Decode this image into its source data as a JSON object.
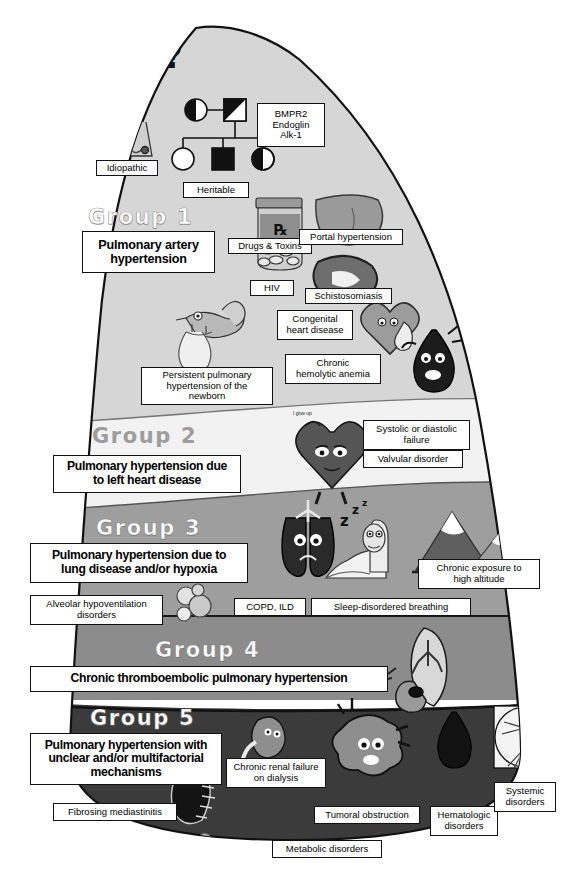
{
  "figure": {
    "shape": "sail-pyramid",
    "band_colors": {
      "group1": "#d6d6d6",
      "group2": "#f0f0f0",
      "group3": "#9e9e9e",
      "group4": "#8a8a8a",
      "group5": "#3b3b3b"
    },
    "outline_color": "#111111"
  },
  "groups": [
    {
      "id": "group1",
      "heading": "Group 1",
      "heading_style": "light",
      "main_label": "Pulmonary artery\nhypertension",
      "items": [
        {
          "label": "Idiopathic",
          "icon": "puzzled-doctor-icon"
        },
        {
          "label": "BMPR2\nEndoglin\nAlk-1",
          "icon": "gene-list-icon"
        },
        {
          "label": "Heritable",
          "icon": "pedigree-chart-icon"
        },
        {
          "label": "Drugs & Toxins",
          "icon": "pill-bottle-icon"
        },
        {
          "label": "Portal hypertension",
          "icon": "liver-icon"
        },
        {
          "label": "HIV",
          "icon": "virus-icon"
        },
        {
          "label": "Schistosomiasis",
          "icon": "schistosome-worm-icon"
        },
        {
          "label": "Congenital\nheart disease",
          "icon": "patched-heart-icon"
        },
        {
          "label": "Chronic\nhemolytic anemia",
          "icon": "blood-drop-icon"
        },
        {
          "label": "Persistent pulmonary\nhypertension of the\nnewborn",
          "icon": "stork-baby-icon"
        }
      ]
    },
    {
      "id": "group2",
      "heading": "Group 2",
      "heading_style": "grey",
      "main_label": "Pulmonary hypertension due\nto left heart disease",
      "items": [
        {
          "label": "Systolic or diastolic\nfailure",
          "icon": "tired-heart-icon"
        },
        {
          "label": "Valvular disorder",
          "icon": "heart-valve-icon"
        }
      ],
      "speech_bubble": "I give up"
    },
    {
      "id": "group3",
      "heading": "Group 3",
      "heading_style": "light",
      "main_label": "Pulmonary hypertension due to\nlung disease and/or hypoxia",
      "items": [
        {
          "label": "Alveolar hypoventilation\ndisorders",
          "icon": "alveoli-icon"
        },
        {
          "label": "COPD, ILD",
          "icon": "sad-lungs-icon"
        },
        {
          "label": "Sleep-disordered breathing",
          "icon": "sleeping-man-icon"
        },
        {
          "label": "Chronic exposure to\nhigh altitude",
          "icon": "mountains-icon"
        }
      ]
    },
    {
      "id": "group4",
      "heading": "Group 4",
      "heading_style": "light",
      "main_label": "Chronic thromboembolic pulmonary hypertension",
      "items": [
        {
          "label": "",
          "icon": "lung-embolus-icon"
        }
      ]
    },
    {
      "id": "group5",
      "heading": "Group 5",
      "heading_style": "light",
      "main_label": "Pulmonary hypertension with\nunclear and/or multifactorial\nmechanisms",
      "items": [
        {
          "label": "Chronic renal failure\non dialysis",
          "icon": "kidney-icon"
        },
        {
          "label": "Fibrosing mediastinitis",
          "icon": "mediastinum-icon"
        },
        {
          "label": "Tumoral obstruction",
          "icon": "tumor-cell-icon"
        },
        {
          "label": "Hematologic\ndisorders",
          "icon": "blood-drop-icon"
        },
        {
          "label": "Systemic\ndisorders",
          "icon": "vitruvian-man-icon"
        },
        {
          "label": "Metabolic disorders",
          "icon": "metabolism-icon"
        }
      ]
    }
  ],
  "caption": ""
}
